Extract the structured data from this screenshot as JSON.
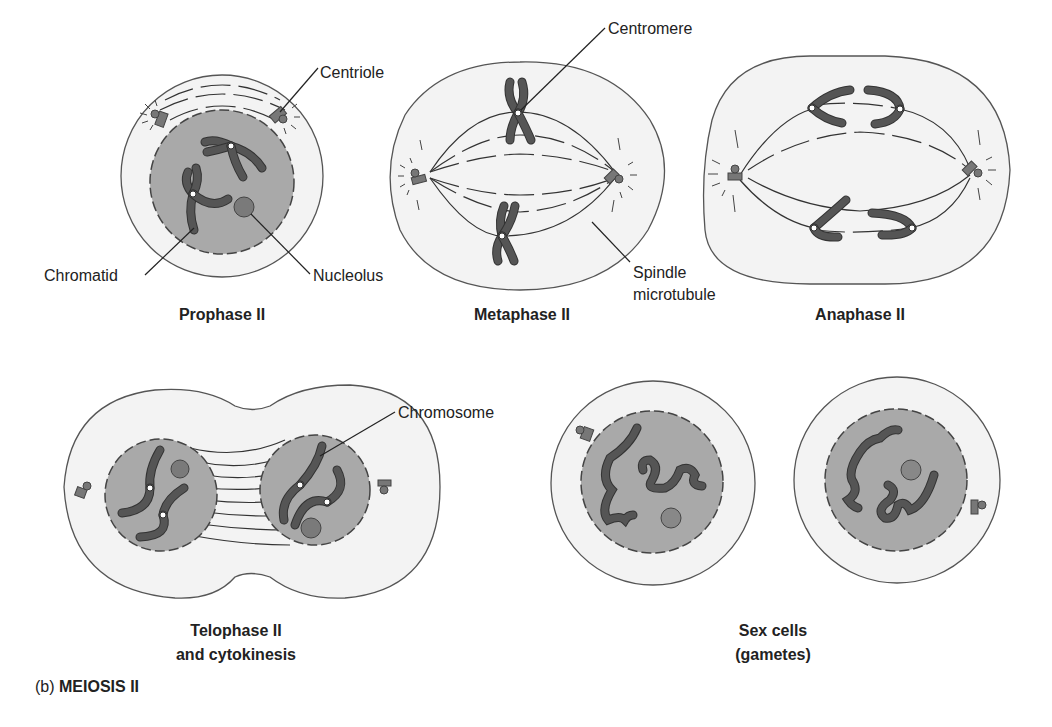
{
  "figure": {
    "panel_label": "(b)",
    "panel_title": "MEIOSIS II",
    "colors": {
      "background": "#ffffff",
      "cytoplasm": "#f3f3f3",
      "nucleus": "#a9a9a9",
      "chromosome": "#666666",
      "outline": "#555555",
      "text": "#222222"
    }
  },
  "stages": [
    {
      "name": "Prophase II"
    },
    {
      "name": "Metaphase II"
    },
    {
      "name": "Anaphase II"
    },
    {
      "name_line1": "Telophase II",
      "name_line2": "and cytokinesis"
    },
    {
      "name_line1": "Sex cells",
      "name_line2": "(gametes)"
    }
  ],
  "callouts": {
    "centriole": "Centriole",
    "chromatid": "Chromatid",
    "nucleolus": "Nucleolus",
    "centromere": "Centromere",
    "spindle_line1": "Spindle",
    "spindle_line2": "microtubule",
    "chromosome": "Chromosome"
  }
}
